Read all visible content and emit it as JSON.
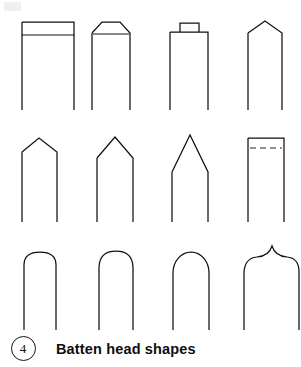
{
  "figure": {
    "number": "4",
    "caption": "Batten head shapes",
    "stroke_color": "#111111",
    "background_color": "#ffffff",
    "rows": [
      {
        "row_index": 1,
        "shapes": [
          {
            "name": "square-flat-head",
            "description": "Square flat top with horizontal batten line below the head"
          },
          {
            "name": "chamfered-head",
            "description": "Flat top with chamfered (bevelled) corners and horizontal batten line"
          },
          {
            "name": "raised-tab-head",
            "description": "Flat top with small raised rectangular tab at centre"
          },
          {
            "name": "shallow-gable-head",
            "description": "Shallow pitched gable peak"
          }
        ]
      },
      {
        "row_index": 2,
        "shapes": [
          {
            "name": "low-pitched-gable-head",
            "description": "Low pitched gable with splayed shoulders"
          },
          {
            "name": "medium-pitched-gable-head",
            "description": "Medium pitched gable peak"
          },
          {
            "name": "steep-pitched-gable-head",
            "description": "Steep tall gable peak"
          },
          {
            "name": "flat-head-dashed-line",
            "description": "Square flat top with dashed horizontal batten line below"
          }
        ]
      },
      {
        "row_index": 3,
        "shapes": [
          {
            "name": "shallow-rounded-head",
            "description": "Flat top with small rounded corners"
          },
          {
            "name": "segmental-arch-head",
            "description": "Segmental arched top"
          },
          {
            "name": "semicircular-arch-head",
            "description": "Full semicircular round arch top"
          },
          {
            "name": "ogee-point-head",
            "description": "Ogee S-curved shoulders rising to a sharp central spire"
          }
        ]
      }
    ]
  }
}
